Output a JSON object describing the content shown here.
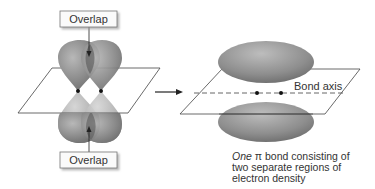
{
  "diagram": {
    "left": {
      "top_label": "Overlap",
      "bottom_label": "Overlap"
    },
    "right": {
      "axis_label": "Bond axis",
      "caption_italic": "One",
      "caption_symbol": "π",
      "caption_rest_line1": " bond consisting of",
      "caption_line2": "two separate regions of",
      "caption_line3": "electron density"
    },
    "colors": {
      "lobe_dark": "#6e6e6e",
      "lobe_mid": "#9a9a9a",
      "lobe_light": "#c8c8c8",
      "line": "#333333"
    }
  }
}
